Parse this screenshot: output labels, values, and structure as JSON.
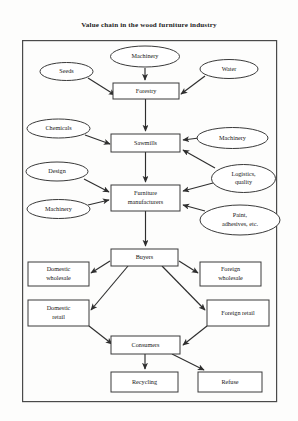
{
  "title": "Value chain in the wood furniture industry",
  "diagram": {
    "type": "flowchart",
    "frame": {
      "x": 22,
      "y": 40,
      "width": 255,
      "height": 362
    },
    "nodes": [
      {
        "id": "seeds",
        "label": "Seeds",
        "shape": "ellipse",
        "cx": 66.5,
        "cy": 71.5,
        "rx": 26.5,
        "ry": 9.0
      },
      {
        "id": "machinery1",
        "label": "Machinery",
        "shape": "ellipse",
        "cx": 145.0,
        "cy": 56.5,
        "rx": 34.5,
        "ry": 10.5
      },
      {
        "id": "water",
        "label": "Water",
        "shape": "ellipse",
        "cx": 229.0,
        "cy": 69.0,
        "rx": 29.0,
        "ry": 9.5
      },
      {
        "id": "forestry",
        "label": "Forestry",
        "shape": "rect",
        "x": 113,
        "y": 83,
        "width": 66,
        "height": 16
      },
      {
        "id": "chemicals",
        "label": "Chemicals",
        "shape": "ellipse",
        "cx": 58.5,
        "cy": 128.5,
        "rx": 31.5,
        "ry": 9.5
      },
      {
        "id": "machinery2",
        "label": "Machinery",
        "shape": "ellipse",
        "cx": 232.5,
        "cy": 138.0,
        "rx": 35.5,
        "ry": 10.5
      },
      {
        "id": "sawmills",
        "label": "Sawmills",
        "shape": "rect",
        "x": 111,
        "y": 134,
        "width": 69,
        "height": 18
      },
      {
        "id": "design",
        "label": "Design",
        "shape": "ellipse",
        "cx": 57.0,
        "cy": 171.5,
        "rx": 31.0,
        "ry": 9.5
      },
      {
        "id": "logistics",
        "label": "Logistics,",
        "label2": "quality",
        "shape": "ellipse",
        "cx": 243.5,
        "cy": 178.5,
        "rx": 32.0,
        "ry": 14.0
      },
      {
        "id": "machinery3",
        "label": "Machinery",
        "shape": "ellipse",
        "cx": 58.5,
        "cy": 209.0,
        "rx": 31.5,
        "ry": 9.5
      },
      {
        "id": "furniture",
        "label": "Furniture",
        "label2": "manufacturers",
        "shape": "rect",
        "x": 111,
        "y": 185,
        "width": 69,
        "height": 26
      },
      {
        "id": "paint",
        "label": "Paint,",
        "label2": "adhesives, etc.",
        "shape": "ellipse",
        "cx": 240.0,
        "cy": 220.0,
        "rx": 40.0,
        "ry": 15.0
      },
      {
        "id": "buyers",
        "label": "Buyers",
        "shape": "rect",
        "x": 111,
        "y": 249,
        "width": 67,
        "height": 17
      },
      {
        "id": "domwholesale",
        "label": "Domestic",
        "label2": "wholesale",
        "shape": "rect",
        "x": 28,
        "y": 262,
        "width": 61,
        "height": 24
      },
      {
        "id": "forwholesale",
        "label": "Foreign",
        "label2": "wholesale",
        "shape": "rect",
        "x": 200,
        "y": 262,
        "width": 61,
        "height": 24
      },
      {
        "id": "domretail",
        "label": "Domestic",
        "label2": "retail",
        "shape": "rect",
        "x": 28,
        "y": 300,
        "width": 61,
        "height": 26
      },
      {
        "id": "forretail",
        "label": "Foreign retail",
        "shape": "rect",
        "x": 207,
        "y": 300,
        "width": 62,
        "height": 26
      },
      {
        "id": "consumers",
        "label": "Consumers",
        "shape": "rect",
        "x": 111,
        "y": 336,
        "width": 69,
        "height": 18
      },
      {
        "id": "recycling",
        "label": "Recycling",
        "shape": "rect",
        "x": 111,
        "y": 372,
        "width": 67,
        "height": 20
      },
      {
        "id": "refuse",
        "label": "Refuse",
        "shape": "rect",
        "x": 198,
        "y": 372,
        "width": 64,
        "height": 20
      }
    ],
    "edges": [
      {
        "from": "seeds",
        "to": "forestry",
        "path": "M 88 78 L 115 95"
      },
      {
        "from": "machinery1",
        "to": "forestry",
        "path": "M 145 68 L 145 80"
      },
      {
        "from": "water",
        "to": "forestry",
        "path": "M 205 76 L 181 94"
      },
      {
        "from": "forestry",
        "to": "sawmills",
        "path": "M 145.5 99 L 145.5 131"
      },
      {
        "from": "chemicals",
        "to": "sawmills",
        "path": "M 85 135 L 110 144"
      },
      {
        "from": "machinery2",
        "to": "sawmills",
        "path": "M 199 138 L 183 140"
      },
      {
        "from": "logistics",
        "to": "sawmills",
        "path": "M 215 168 L 183 150"
      },
      {
        "from": "sawmills",
        "to": "furniture",
        "path": "M 145.5 152 L 145.5 182"
      },
      {
        "from": "design",
        "to": "furniture",
        "path": "M 84 179 L 109 192"
      },
      {
        "from": "logistics",
        "to": "furniture",
        "path": "M 213 183 L 183 191"
      },
      {
        "from": "machinery3",
        "to": "furniture",
        "path": "M 88 205 L 109 200"
      },
      {
        "from": "paint",
        "to": "furniture",
        "path": "M 205 211 L 183 205"
      },
      {
        "from": "furniture",
        "to": "buyers",
        "path": "M 145.5 211 L 145.5 246"
      },
      {
        "from": "buyers",
        "to": "domwholesale",
        "path": "M 110 261 L 91 273"
      },
      {
        "from": "buyers",
        "to": "forwholesale",
        "path": "M 179 261 L 198 273"
      },
      {
        "from": "buyers",
        "to": "domretail",
        "path": "M 128 266 L 91 310"
      },
      {
        "from": "buyers",
        "to": "forretail",
        "path": "M 162 266 L 205 310"
      },
      {
        "from": "domretail",
        "to": "consumers",
        "path": "M 89 326 L 112 344"
      },
      {
        "from": "forretail",
        "to": "consumers",
        "path": "M 207 326 L 183 345"
      },
      {
        "from": "consumers",
        "to": "recycling",
        "path": "M 145 354 L 145 369"
      },
      {
        "from": "consumers",
        "to": "refuse",
        "path": "M 172 354 L 204 370"
      }
    ]
  }
}
